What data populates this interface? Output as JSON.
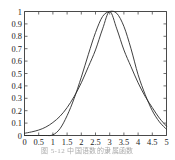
{
  "caption": {
    "text": "图 5-12    中国语数的隶属函数"
  },
  "chart_data": {
    "type": "line",
    "title": "",
    "xlabel": "",
    "ylabel": "",
    "xlim": [
      0,
      5
    ],
    "ylim": [
      0,
      1
    ],
    "grid": false,
    "legend": "none",
    "x_ticks": [
      0,
      0.5,
      1,
      1.5,
      2,
      2.5,
      3,
      3.5,
      4,
      4.5,
      5
    ],
    "x_tick_labels": [
      "0",
      "0.5",
      "1",
      "1.5",
      "2",
      "2.5",
      "3",
      "3.5",
      "4",
      "4.5",
      "5"
    ],
    "y_ticks": [
      0,
      0.1,
      0.2,
      0.3,
      0.4,
      0.5,
      0.6,
      0.7,
      0.8,
      0.9,
      1
    ],
    "y_tick_labels": [
      "0",
      "0.1",
      "0.2",
      "0.3",
      "0.4",
      "0.5",
      "0.6",
      "0.7",
      "0.8",
      "0.9",
      "1"
    ],
    "colors": {
      "curve": "#2a2a2a",
      "axis": "#4a4a4a",
      "background": "#ffffff"
    },
    "series": [
      {
        "name": "gaussian-curve",
        "x": [
          0,
          0.25,
          0.5,
          0.75,
          1,
          1.25,
          1.5,
          1.75,
          2,
          2.25,
          2.5,
          2.75,
          3,
          3.25,
          3.5,
          3.75,
          4,
          4.25,
          4.5,
          4.75,
          5
        ],
        "values": [
          0.018,
          0.029,
          0.044,
          0.068,
          0.105,
          0.155,
          0.225,
          0.315,
          0.425,
          0.555,
          0.69,
          0.86,
          1.0,
          0.86,
          0.69,
          0.555,
          0.425,
          0.315,
          0.225,
          0.14,
          0.075
        ]
      },
      {
        "name": "pi-shaped-curve",
        "x": [
          0,
          0.25,
          0.5,
          0.75,
          1,
          1.25,
          1.5,
          1.75,
          2,
          2.25,
          2.5,
          2.75,
          3,
          3.25,
          3.5,
          3.75,
          4,
          4.25,
          4.5,
          4.75,
          5
        ],
        "values": [
          0.0,
          0.0,
          0.0,
          0.0,
          0.005,
          0.055,
          0.16,
          0.3,
          0.47,
          0.655,
          0.83,
          0.96,
          1.0,
          0.985,
          0.88,
          0.7,
          0.49,
          0.33,
          0.2,
          0.11,
          0.05
        ]
      }
    ]
  }
}
